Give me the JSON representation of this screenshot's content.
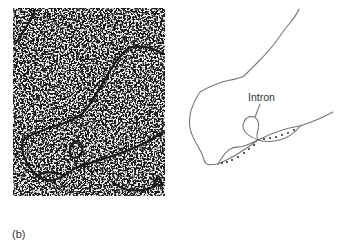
{
  "figure": {
    "panel_label": "(b)",
    "micrograph": {
      "description": "electron micrograph of DNA-RNA hybrid showing R-loop with intron loop",
      "background_color": "#ececec",
      "grain_color": "#1a1a1a"
    },
    "diagram": {
      "intron_label": "Intron",
      "line_color": "#777777",
      "dot_color": "#111111"
    }
  }
}
